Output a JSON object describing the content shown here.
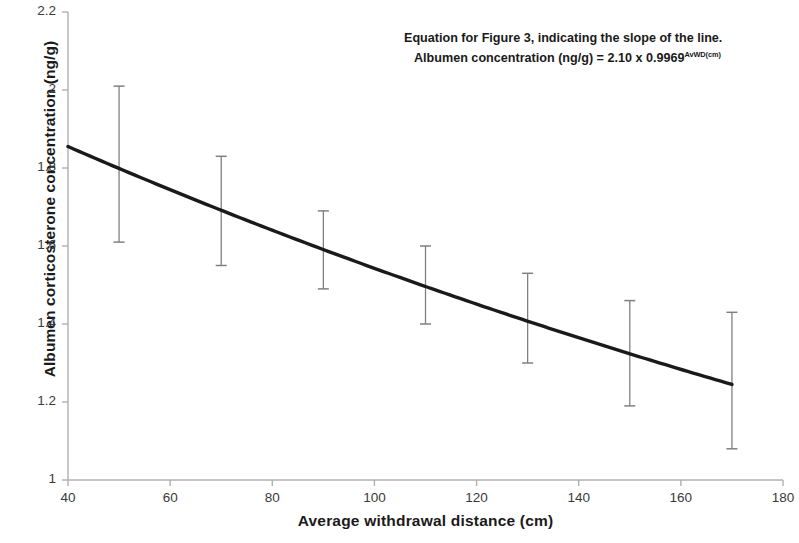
{
  "chart_data": {
    "type": "line",
    "title": "",
    "xlabel": "Average withdrawal distance (cm)",
    "ylabel": "Albumen corticosterone concentration (ng/g)",
    "xlim": [
      40,
      180
    ],
    "ylim": [
      1,
      2.2
    ],
    "xticks": [
      40,
      60,
      80,
      100,
      120,
      140,
      160,
      180
    ],
    "yticks": [
      1,
      1.2,
      1.4,
      1.6,
      1.8,
      2,
      2.2
    ],
    "xtick_labels": [
      "40",
      "60",
      "80",
      "100",
      "120",
      "140",
      "160",
      "180"
    ],
    "ytick_labels": [
      "1",
      "1.2",
      "1.4",
      "1.6",
      "1.8",
      "2",
      "2.2"
    ],
    "grid": false,
    "legend": null,
    "series": [
      {
        "name": "Fitted exponential decay",
        "style": "solid-line",
        "color": "#1a1a1a",
        "x": [
          40,
          170
        ],
        "y": [
          1.855,
          1.245
        ],
        "equation_a": 2.1,
        "equation_b": 0.9969
      },
      {
        "name": "Mean with error bars",
        "style": "error-bars",
        "color": "#808080",
        "x": [
          50,
          70,
          90,
          110,
          130,
          150,
          170
        ],
        "y": [
          1.8,
          1.69,
          1.59,
          1.5,
          1.41,
          1.32,
          1.24
        ],
        "y_upper": [
          2.01,
          1.83,
          1.69,
          1.6,
          1.53,
          1.46,
          1.43
        ],
        "y_lower": [
          1.61,
          1.55,
          1.49,
          1.4,
          1.3,
          1.19,
          1.08
        ]
      }
    ],
    "annotation": {
      "line1": "Equation for Figure 3, indicating the slope of the line.",
      "line2_prefix": "Albumen concentration (ng/g) = 2.10 x 0.9969",
      "line2_superscript": "AvWD(cm)"
    }
  },
  "axis": {
    "y_title": "Albumen corticosterone concentration (ng/g)",
    "x_title": "Average withdrawal distance (cm)"
  }
}
